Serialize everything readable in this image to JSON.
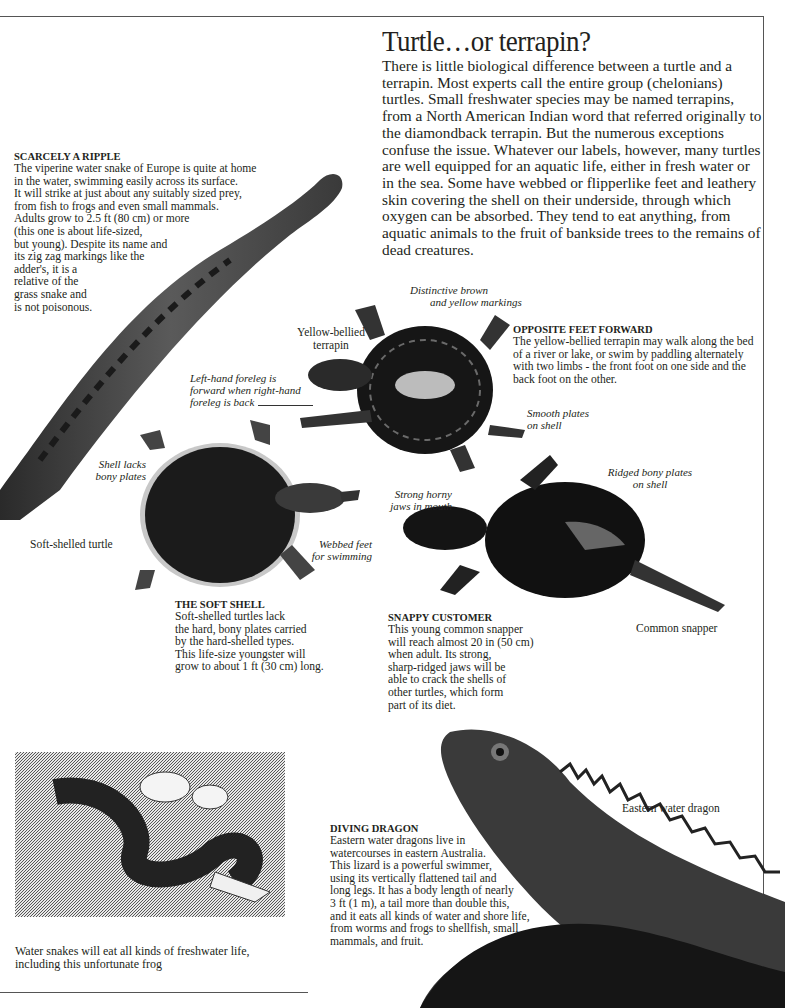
{
  "page": {
    "title": "Turtle…or terrapin?",
    "intro": "There is little biological difference between a turtle and a terrapin. Most experts call the entire group (chelonians) turtles. Small freshwater species may be named terrapins, from a North American Indian word that referred originally to the diamondback terrapin. But the numerous exceptions confuse the issue. Whatever our labels, however, many turtles are well equipped for an aquatic life, either in fresh water or in the sea. Some have webbed or flipperlike feet and leathery skin covering the shell on their underside, through which oxygen can be absorbed. They tend to eat anything, from aquatic animals to the fruit of bankside trees to the remains of dead creatures."
  },
  "sections": {
    "ripple": {
      "heading": "SCARCELY A RIPPLE",
      "lines": [
        "The viperine water snake of Europe is quite at home",
        "in the water, swimming easily across its surface.",
        "It will strike at just about any suitably sized prey,",
        "from fish to frogs and even small mammals.",
        "Adults grow to 2.5 ft (80 cm) or more",
        "(this one is about life-sized,",
        "but young). Despite its name and",
        "its zig zag markings like the",
        "adder's, it is a",
        "relative of the",
        "grass snake and",
        "is not poisonous."
      ]
    },
    "opposite": {
      "heading": "OPPOSITE FEET FORWARD",
      "body": "The yellow-bellied terrapin may walk along the bed of a river or lake, or swim by paddling alternately with two limbs - the front foot on one side and the back foot on the other."
    },
    "soft_shell": {
      "heading": "THE SOFT SHELL",
      "lines": [
        "Soft-shelled turtles lack",
        "the hard, bony plates carried",
        "by the hard-shelled types.",
        "This life-size youngster will",
        "grow to about 1 ft (30 cm) long."
      ]
    },
    "snappy": {
      "heading": "SNAPPY CUSTOMER",
      "lines": [
        "This young common snapper",
        "will reach almost 20 in (50 cm)",
        "when adult. Its strong,",
        "sharp-ridged jaws will be",
        "able to crack the shells of",
        "other turtles, which form",
        "part of its diet."
      ]
    },
    "dragon": {
      "heading": "DIVING DRAGON",
      "lines": [
        "Eastern water dragons live in",
        "watercourses in eastern Australia.",
        "This lizard is a powerful swimmer,",
        "using its vertically flattened tail and",
        "long legs. It has a body length of nearly",
        "3 ft (1 m), a tail more than double this,",
        "and it eats all kinds of water and shore life,",
        "from worms and frogs to shellfish, small",
        "mammals, and fruit."
      ]
    }
  },
  "labels": {
    "yellow_bellied": [
      "Yellow-bellied",
      "terrapin"
    ],
    "distinctive": [
      "Distinctive brown",
      "and yellow markings"
    ],
    "left_foreleg": [
      "Left-hand foreleg is",
      "forward when right-hand",
      "foreleg is back"
    ],
    "smooth_plates": [
      "Smooth plates",
      "on shell"
    ],
    "shell_lacks": [
      "Shell lacks",
      "bony plates"
    ],
    "soft_shelled": "Soft-shelled turtle",
    "webbed_feet": [
      "Webbed feet",
      "for swimming"
    ],
    "strong_jaws": [
      "Strong horny",
      "jaws in mouth"
    ],
    "ridged_plates": [
      "Ridged bony plates",
      "on shell"
    ],
    "common_snapper": "Common snapper",
    "eastern_dragon": "Eastern water dragon"
  },
  "engraving": {
    "caption": [
      "Water snakes will eat all kinds of freshwater life,",
      "including this unfortunate frog"
    ]
  }
}
